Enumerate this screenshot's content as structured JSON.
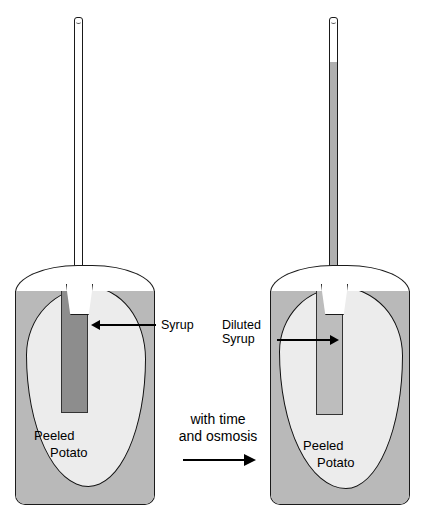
{
  "diagram": {
    "type": "biology-process-diagram",
    "colors": {
      "water": "#b9b9b9",
      "potato": "#ececec",
      "syrup_concentrated": "#8d8d8d",
      "syrup_diluted": "#bdbdbd",
      "outline": "#111111",
      "background": "#ffffff"
    }
  },
  "left_panel": {
    "name": "before",
    "potato_label_line1": "Peeled",
    "potato_label_line2": "Potato",
    "callout_label": "Syrup",
    "callout_direction": "points-left",
    "tube_liquid_level": "empty",
    "syrup_shade": "dark"
  },
  "right_panel": {
    "name": "after",
    "potato_label_line1": "Peeled",
    "potato_label_line2": "Potato",
    "callout_label_line1": "Diluted",
    "callout_label_line2": "Syrup",
    "callout_direction": "points-right",
    "tube_liquid_level": "near-top",
    "syrup_shade": "light"
  },
  "transition": {
    "caption_line1": "with time",
    "caption_line2": "and osmosis",
    "arrow": "right-arrow"
  }
}
